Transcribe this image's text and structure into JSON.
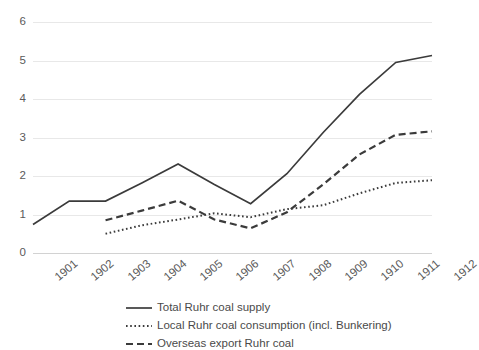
{
  "chart_data": {
    "type": "line",
    "title": "",
    "xlabel": "",
    "ylabel": "",
    "categories": [
      "1901",
      "1902",
      "1903",
      "1904",
      "1905",
      "1906",
      "1907",
      "1908",
      "1909",
      "1910",
      "1911",
      "1912"
    ],
    "xticklabels": [
      "1901",
      "1902",
      "1903",
      "1904",
      "1905",
      "1906",
      "1907",
      "1908",
      "1909",
      "1910",
      "1911",
      "1912"
    ],
    "yticklabels": [
      "0",
      "1",
      "2",
      "3",
      "4",
      "5",
      "6"
    ],
    "yticks": [
      0,
      1,
      2,
      3,
      4,
      5,
      6
    ],
    "ylim": [
      0,
      6
    ],
    "grid": "horizontal",
    "legend_position": "bottom",
    "series": [
      {
        "name": "Total Ruhr coal supply",
        "style": "solid",
        "color": "#3b3b3b",
        "x": [
          "1901",
          "1902",
          "1903",
          "1904",
          "1905",
          "1906",
          "1907",
          "1908",
          "1909",
          "1910",
          "1911",
          "1912"
        ],
        "values": [
          0.74,
          1.35,
          1.35,
          1.82,
          2.31,
          1.78,
          1.28,
          2.06,
          3.13,
          4.12,
          4.95,
          5.13
        ]
      },
      {
        "name": "Local Ruhr coal consumption (incl. Bunkering)",
        "style": "dotted",
        "color": "#3b3b3b",
        "x": [
          "1903",
          "1904",
          "1905",
          "1906",
          "1907",
          "1908",
          "1909",
          "1910",
          "1911",
          "1912"
        ],
        "values": [
          0.5,
          0.72,
          0.87,
          1.03,
          0.93,
          1.14,
          1.24,
          1.55,
          1.82,
          1.89
        ]
      },
      {
        "name": "Overseas export Ruhr coal",
        "style": "dashed",
        "color": "#3b3b3b",
        "x": [
          "1903",
          "1904",
          "1905",
          "1906",
          "1907",
          "1908",
          "1909",
          "1910",
          "1911",
          "1912"
        ],
        "values": [
          0.85,
          1.1,
          1.36,
          0.87,
          0.64,
          1.06,
          1.78,
          2.56,
          3.07,
          3.16
        ]
      }
    ]
  },
  "legend": {
    "items": [
      {
        "label": "Total Ruhr coal supply",
        "marker": "solid-line-marker"
      },
      {
        "label": "Local Ruhr coal consumption (incl. Bunkering)",
        "marker": "dotted-line-marker"
      },
      {
        "label": "Overseas export Ruhr coal",
        "marker": "dashed-line-marker"
      }
    ]
  }
}
